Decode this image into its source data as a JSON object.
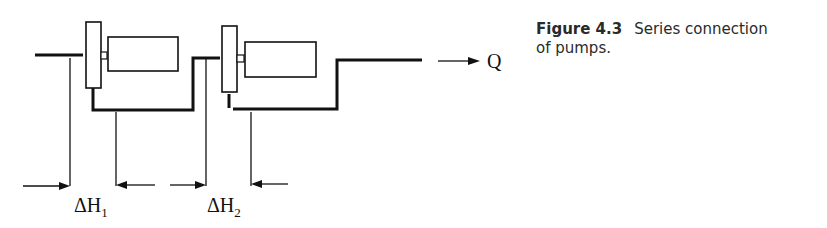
{
  "diagram": {
    "flow_label": "Q",
    "head_labels": [
      {
        "symbol": "ΔH",
        "subscript": "1"
      },
      {
        "symbol": "ΔH",
        "subscript": "2"
      }
    ],
    "components": [
      "pump-1",
      "motor-1",
      "pump-2",
      "motor-2",
      "inlet-pipe",
      "connecting-pipe",
      "outlet-pipe"
    ]
  },
  "caption": {
    "label": "Figure 4.3",
    "text_line1": "Series connection",
    "text_line2": "of pumps."
  }
}
